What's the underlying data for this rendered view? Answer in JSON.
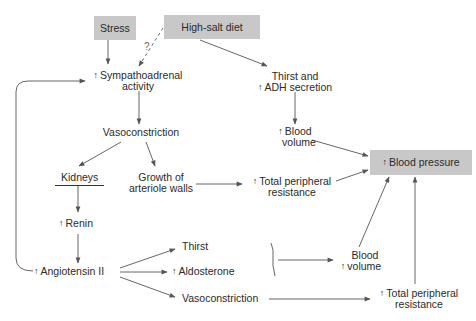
{
  "diagram": {
    "nodes": {
      "stress": {
        "label": "Stress",
        "style": "shaded-box"
      },
      "high_salt_diet": {
        "label": "High-salt diet",
        "style": "shaded-box"
      },
      "sympathoadrenal": {
        "prefix": "↑",
        "line1": "Sympathoadrenal",
        "line2": "activity"
      },
      "thirst_adh": {
        "prefix": "↑",
        "line1": "Thirst and",
        "line2": "ADH secretion"
      },
      "vasoconstriction_1": {
        "label": "Vasoconstriction"
      },
      "blood_volume_1": {
        "prefix": "↑",
        "line1": "Blood",
        "line2": "volume"
      },
      "kidneys": {
        "label": "Kidneys"
      },
      "growth_arteriole": {
        "line1": "Growth of",
        "line2": "arteriole walls"
      },
      "tpr_1": {
        "prefix": "↑",
        "line1": "Total peripheral",
        "line2": "resistance"
      },
      "blood_pressure": {
        "prefix": "↑",
        "label": "Blood pressure",
        "style": "shaded-box"
      },
      "renin": {
        "prefix": "↑",
        "label": "Renin"
      },
      "thirst": {
        "label": "Thirst"
      },
      "aldosterone": {
        "prefix": "↑",
        "label": "Aldosterone"
      },
      "angiotensin": {
        "prefix": "↑",
        "label": "Angiotensin II"
      },
      "blood_volume_2": {
        "prefix": "↑",
        "line1": "Blood",
        "line2": "volume"
      },
      "vasoconstriction_2": {
        "label": "Vasoconstriction"
      },
      "tpr_2": {
        "prefix": "↑",
        "line1": "Total peripheral",
        "line2": "resistance"
      }
    },
    "uncertain_link_label": "?",
    "colors": {
      "box_fill": "#c8c8c8",
      "arrow": "#555555",
      "text": "#2a2a2a"
    },
    "edges": [
      {
        "from": "stress",
        "to": "sympathoadrenal"
      },
      {
        "from": "high_salt_diet",
        "to": "sympathoadrenal",
        "style": "dashed",
        "label": "?"
      },
      {
        "from": "high_salt_diet",
        "to": "thirst_adh"
      },
      {
        "from": "sympathoadrenal",
        "to": "vasoconstriction_1"
      },
      {
        "from": "thirst_adh",
        "to": "blood_volume_1"
      },
      {
        "from": "vasoconstriction_1",
        "to": "kidneys"
      },
      {
        "from": "vasoconstriction_1",
        "to": "growth_arteriole"
      },
      {
        "from": "growth_arteriole",
        "to": "tpr_1"
      },
      {
        "from": "blood_volume_1",
        "to": "blood_pressure"
      },
      {
        "from": "tpr_1",
        "to": "blood_pressure"
      },
      {
        "from": "kidneys",
        "to": "renin"
      },
      {
        "from": "renin",
        "to": "angiotensin"
      },
      {
        "from": "angiotensin",
        "to": "sympathoadrenal"
      },
      {
        "from": "angiotensin",
        "to": "thirst"
      },
      {
        "from": "angiotensin",
        "to": "aldosterone"
      },
      {
        "from": "angiotensin",
        "to": "vasoconstriction_2"
      },
      {
        "from": "thirst+aldosterone",
        "to": "blood_volume_2"
      },
      {
        "from": "vasoconstriction_2",
        "to": "tpr_2"
      },
      {
        "from": "blood_volume_2",
        "to": "blood_pressure"
      },
      {
        "from": "tpr_2",
        "to": "blood_pressure"
      }
    ]
  }
}
